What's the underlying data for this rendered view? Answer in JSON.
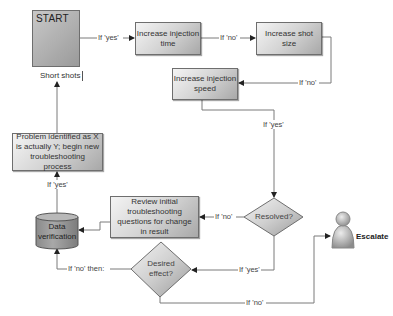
{
  "diagram": {
    "type": "flowchart",
    "start": {
      "title": "START",
      "label": "Short shots",
      "icon": "clipboard-alert-icon"
    },
    "nodes": {
      "increase_injection_time": "Increase injection time",
      "increase_shot_size": "Increase shot size",
      "increase_injection_speed": "Increase injection speed",
      "resolved": "Resolved?",
      "review_questions": "Review initial troubleshooting questions for change in result",
      "desired_effect": "Desired effect?",
      "data_verification": "Data verification",
      "problem_identified": "Problem identified as X is actually Y; begin new troubleshooting process",
      "escalate": "Escalate"
    },
    "edges": {
      "start_to_time": "If 'yes'",
      "time_to_shot": "If 'no'",
      "shot_to_speed": "If 'no'",
      "speed_to_resolved": "If 'yes'",
      "resolved_to_review": "If 'no'",
      "resolved_to_desired": "If 'yes'",
      "desired_to_data": "If 'no' then:",
      "desired_to_escalate": "If 'no'",
      "data_to_problem": "If 'yes'"
    },
    "colors": {
      "box_light": "#f4f4f4",
      "box_dark": "#a8a8a8",
      "line": "#777777",
      "person": "#9a9a9a"
    }
  }
}
